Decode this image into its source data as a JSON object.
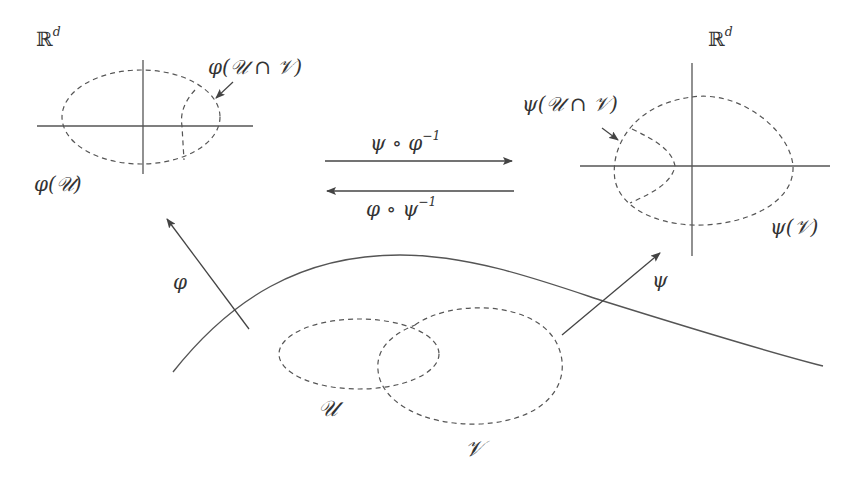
{
  "figure": {
    "title": "",
    "colors": {
      "stroke": "#555555",
      "text": "#333333",
      "background": "#ffffff"
    },
    "left_chart": {
      "space_label": {
        "base": "ℝ",
        "sup": "d"
      },
      "domain_label": {
        "prefix": "φ(",
        "set": "𝒰",
        "suffix": ")"
      },
      "intersection_label": {
        "prefix": "φ(",
        "set": "𝒰 ∩ 𝒱",
        "suffix": ")"
      }
    },
    "right_chart": {
      "space_label": {
        "base": "ℝ",
        "sup": "d"
      },
      "domain_label": {
        "prefix": "ψ(",
        "set": "𝒱",
        "suffix": ")"
      },
      "intersection_label": {
        "prefix": "ψ(",
        "set": "𝒰 ∩ 𝒱",
        "suffix": ")"
      }
    },
    "transition_maps": {
      "forward": {
        "text": "ψ ∘ φ",
        "sup": "−1",
        "direction": "right"
      },
      "backward": {
        "text": "φ ∘ ψ",
        "sup": "−1",
        "direction": "left"
      }
    },
    "chart_maps": {
      "left": {
        "text": "φ"
      },
      "right": {
        "text": "ψ"
      }
    },
    "manifold": {
      "set_u": {
        "text": "𝒰"
      },
      "set_v": {
        "text": "𝒱"
      }
    }
  }
}
